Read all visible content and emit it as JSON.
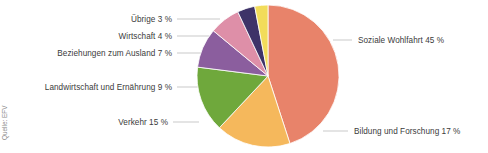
{
  "chart_data": {
    "type": "pie",
    "title": "",
    "subtitle": "",
    "xlabel": "",
    "ylabel": "",
    "legend_position": "leader-labels",
    "grid": false,
    "unit": "%",
    "total": 100,
    "categories": [
      "Soziale Wohlfahrt",
      "Bildung und Forschung",
      "Verkehr",
      "Landwirtschaft und Ernährung",
      "Beziehungen zum Ausland",
      "Wirtschaft",
      "Übrige"
    ],
    "values": [
      45,
      17,
      15,
      9,
      7,
      4,
      3
    ],
    "colors": [
      "#e8836a",
      "#f5b85c",
      "#6fa83c",
      "#8b5e9e",
      "#de8fa8",
      "#3e3368",
      "#f2dc5a"
    ],
    "labels": [
      "Soziale Wohlfahrt 45 %",
      "Bildung und Forschung 17 %",
      "Verkehr 15 %",
      "Landwirtschaft und Ernährung 9 %",
      "Beziehungen zum Ausland 7 %",
      "Wirtschaft 4 %",
      "Übrige 3 %"
    ]
  },
  "source": {
    "note": "Quelle: EFV"
  }
}
